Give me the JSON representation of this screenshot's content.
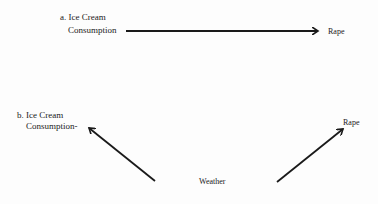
{
  "diagram": {
    "panel_a": {
      "label_line1": "a. Ice Cream",
      "label_line2": "Consumption",
      "target": "Rape"
    },
    "panel_b": {
      "label_line1": "b. Ice Cream",
      "label_line2": "Consumption-",
      "source": "Weather",
      "target": "Rape"
    },
    "colors": {
      "ink": "#1a1a1a",
      "background": "#fdfdfd"
    }
  }
}
